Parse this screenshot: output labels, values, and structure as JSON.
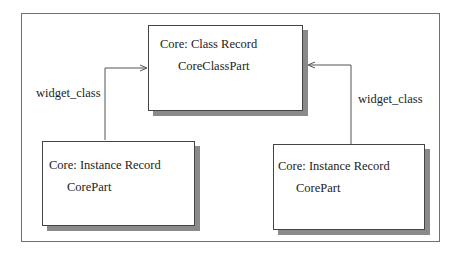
{
  "diagram": {
    "nodes": [
      {
        "id": "class-record",
        "title": "Core: Class Record",
        "part": "CoreClassPart"
      },
      {
        "id": "instance-record-left",
        "title": "Core: Instance Record",
        "part": "CorePart"
      },
      {
        "id": "instance-record-right",
        "title": "Core: Instance Record",
        "part": "CorePart"
      }
    ],
    "edges": [
      {
        "from": "instance-record-left",
        "to": "class-record",
        "label": "widget_class"
      },
      {
        "from": "instance-record-right",
        "to": "class-record",
        "label": "widget_class"
      }
    ]
  }
}
